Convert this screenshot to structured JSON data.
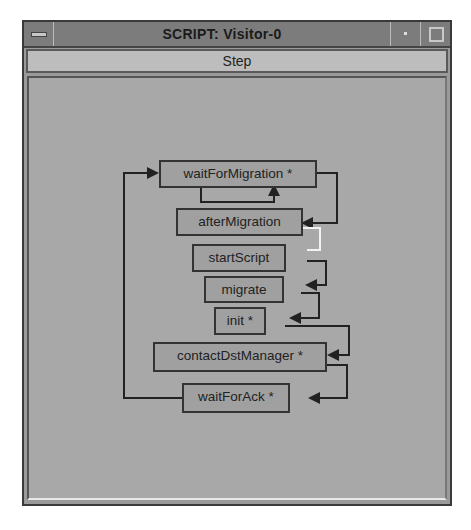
{
  "window": {
    "title": "SCRIPT: Visitor-0",
    "buttons": {
      "menu": "window-menu",
      "minimize": "minimize",
      "maximize": "maximize"
    }
  },
  "toolbar": {
    "step_label": "Step"
  },
  "graph": {
    "nodes": [
      {
        "id": "waitForMigration",
        "label": "waitForMigration *"
      },
      {
        "id": "afterMigration",
        "label": "afterMigration"
      },
      {
        "id": "startScript",
        "label": "startScript"
      },
      {
        "id": "migrate",
        "label": "migrate"
      },
      {
        "id": "init",
        "label": "init *"
      },
      {
        "id": "contactDstManager",
        "label": "contactDstManager *"
      },
      {
        "id": "waitForAck",
        "label": "waitForAck *"
      }
    ],
    "highlighted_edge": "afterMigration -> startScript",
    "colors": {
      "edge": "#222222",
      "highlight": "#f2f2f2",
      "node_border": "#333333"
    }
  }
}
